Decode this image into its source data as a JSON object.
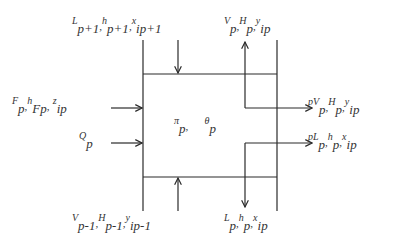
{
  "diagram": {
    "stage_variables": {
      "pressure": {
        "symbol": "π",
        "sub": "p",
        "suffix": ","
      },
      "temperature": {
        "symbol": "θ",
        "sub": "p"
      }
    },
    "streams": {
      "liquid_in_top": {
        "parts": [
          {
            "sup": "L",
            "sub": "p+1",
            "sep": ","
          },
          {
            "sup": "h",
            "sub": "p+1",
            "sep": ","
          },
          {
            "sup": "x",
            "sub": "ip+1",
            "sep": ""
          }
        ]
      },
      "vapor_out_top": {
        "parts": [
          {
            "sup": "V",
            "sub": "p",
            "sep": ","
          },
          {
            "sup": "H",
            "sub": "p",
            "sep": ","
          },
          {
            "sup": "y",
            "sub": "ip",
            "sep": ""
          }
        ]
      },
      "feed_in": {
        "parts": [
          {
            "sup": "F",
            "sub": "p",
            "sep": ","
          },
          {
            "sup": "h",
            "sub": "Fp",
            "sep": ","
          },
          {
            "sup": "z",
            "sub": "ip",
            "sep": ""
          }
        ]
      },
      "heat_in": {
        "parts": [
          {
            "sup": "Q",
            "sub": "p",
            "sep": ""
          }
        ]
      },
      "vapor_sidedraw": {
        "prefix": "p",
        "parts": [
          {
            "sup": "V",
            "sub": "p",
            "sep": ","
          },
          {
            "sup": "H",
            "sub": "p",
            "sep": ","
          },
          {
            "sup": "y",
            "sub": "ip",
            "sep": ""
          }
        ]
      },
      "liquid_sidedraw": {
        "prefix": "p",
        "parts": [
          {
            "sup": "L",
            "sub": "p",
            "sep": ","
          },
          {
            "sup": "h",
            "sub": "p",
            "sep": ","
          },
          {
            "sup": "x",
            "sub": "ip",
            "sep": ""
          }
        ]
      },
      "vapor_in_bottom": {
        "parts": [
          {
            "sup": "V",
            "sub": "p-1",
            "sep": ","
          },
          {
            "sup": "H",
            "sub": "p-1",
            "sep": ","
          },
          {
            "sup": "y",
            "sub": "ip-1",
            "sep": ""
          }
        ]
      },
      "liquid_out_bottom": {
        "parts": [
          {
            "sup": "L",
            "sub": "p",
            "sep": ","
          },
          {
            "sup": "h",
            "sub": "p",
            "sep": ","
          },
          {
            "sup": "x",
            "sub": "ip",
            "sep": ""
          }
        ]
      }
    },
    "colors": {
      "line": "#2a2a2a",
      "background": "#ffffff"
    }
  }
}
